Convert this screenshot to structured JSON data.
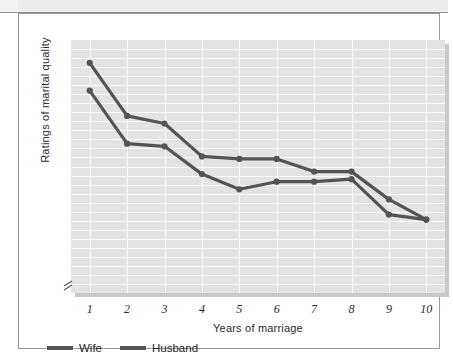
{
  "figure": {
    "y_axis_title": "Ratings of marital quality",
    "x_axis_title": "Years of marriage",
    "axis_break_icon": "axis-break-icon"
  },
  "legend": {
    "items": [
      {
        "label": "Wife",
        "color": "#545454",
        "swatch_icon": "line-swatch-icon"
      },
      {
        "label": "Husband",
        "color": "#545454",
        "swatch_icon": "line-swatch-icon"
      }
    ]
  },
  "chart_data": {
    "type": "line",
    "title": "",
    "xlabel": "Years of marriage",
    "ylabel": "Ratings of marital quality",
    "x": [
      1,
      2,
      3,
      4,
      5,
      6,
      7,
      8,
      9,
      10
    ],
    "categories": [
      "1",
      "2",
      "3",
      "4",
      "5",
      "6",
      "7",
      "8",
      "9",
      "10"
    ],
    "xlim": [
      0.5,
      10.5
    ],
    "ylim": [
      0,
      100
    ],
    "y_axis_ticks_shown": false,
    "y_axis_has_break": true,
    "grid": true,
    "grid_color": "#fbfbfb",
    "plot_background": "#e3e3e3",
    "legend_position": "below-plot-left",
    "series": [
      {
        "name": "Wife",
        "color": "#545454",
        "marker": "circle",
        "values": [
          91,
          70,
          67,
          54,
          53,
          53,
          48,
          48,
          37,
          29
        ]
      },
      {
        "name": "Husband",
        "color": "#545454",
        "marker": "circle",
        "values": [
          80,
          59,
          58,
          47,
          41,
          44,
          44,
          45,
          31,
          29
        ]
      }
    ]
  }
}
